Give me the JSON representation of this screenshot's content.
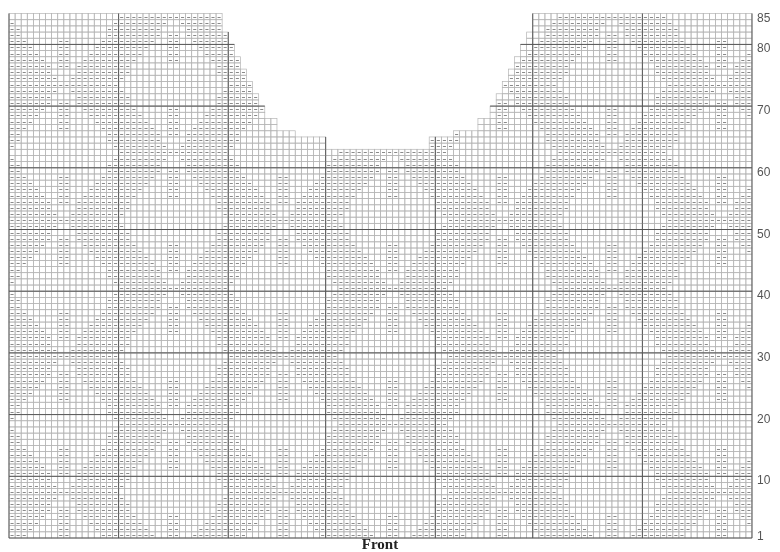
{
  "chart": {
    "title": "Front",
    "type": "knitting-chart",
    "grid": {
      "columns": 122,
      "rows": 85,
      "origin_x": 9,
      "bottom_y": 538,
      "cell_w": 6.09,
      "cell_h": 6.17,
      "thin_line_color": "#b5b5b5",
      "thick_line_color": "#555555",
      "symbol_color": "#8a8a8a",
      "thick_row_every": 10,
      "thick_columns": [
        0,
        18,
        36,
        52,
        70,
        86,
        104,
        122
      ]
    },
    "neck_shaping": {
      "left_shoulder_last_col": 35,
      "right_shoulder_first_col": 87,
      "neck_bottom_row": 63,
      "left_steps": [
        {
          "row": 64,
          "last_col": 52
        },
        {
          "row": 66,
          "last_col": 47
        },
        {
          "row": 67,
          "last_col": 44
        },
        {
          "row": 69,
          "last_col": 42
        },
        {
          "row": 71,
          "last_col": 41
        },
        {
          "row": 73,
          "last_col": 40
        },
        {
          "row": 75,
          "last_col": 39
        },
        {
          "row": 77,
          "last_col": 38
        },
        {
          "row": 79,
          "last_col": 37
        },
        {
          "row": 81,
          "last_col": 36
        },
        {
          "row": 83,
          "last_col": 35
        }
      ],
      "right_steps": [
        {
          "row": 64,
          "first_col": 70
        },
        {
          "row": 66,
          "first_col": 74
        },
        {
          "row": 67,
          "first_col": 78
        },
        {
          "row": 69,
          "first_col": 80
        },
        {
          "row": 71,
          "first_col": 81
        },
        {
          "row": 73,
          "first_col": 82
        },
        {
          "row": 75,
          "first_col": 83
        },
        {
          "row": 77,
          "first_col": 84
        },
        {
          "row": 79,
          "first_col": 85
        },
        {
          "row": 81,
          "first_col": 86
        },
        {
          "row": 83,
          "first_col": 87
        }
      ]
    },
    "motif": {
      "symbol": "dash",
      "block_width": 18,
      "row_repeat": 22,
      "row_offset": 3
    },
    "row_labels": [
      {
        "text": "85",
        "row": 85
      },
      {
        "text": "80",
        "row": 80
      },
      {
        "text": "70",
        "row": 70
      },
      {
        "text": "60",
        "row": 60
      },
      {
        "text": "50",
        "row": 50
      },
      {
        "text": "40",
        "row": 40
      },
      {
        "text": "30",
        "row": 30
      },
      {
        "text": "20",
        "row": 20
      },
      {
        "text": "10",
        "row": 10
      },
      {
        "text": "1",
        "row": 1
      }
    ]
  }
}
